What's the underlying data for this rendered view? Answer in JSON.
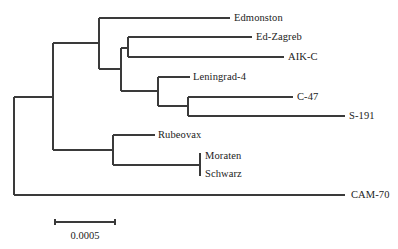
{
  "diagram": {
    "type": "phylogenetic-tree",
    "line_color": "#3a3a3a",
    "text_color": "#222222",
    "taxa": [
      {
        "name": "Edmonston",
        "y": 18,
        "x_end": 230,
        "label_x": 234
      },
      {
        "name": "Ed-Zagreb",
        "y": 37,
        "x_end": 252,
        "label_x": 256
      },
      {
        "name": "AIK-C",
        "y": 57,
        "x_end": 284,
        "label_x": 288
      },
      {
        "name": "Leningrad-4",
        "y": 77,
        "x_end": 190,
        "label_x": 193
      },
      {
        "name": "C-47",
        "y": 97,
        "x_end": 293,
        "label_x": 297
      },
      {
        "name": "S-191",
        "y": 116,
        "x_end": 345,
        "label_x": 349
      },
      {
        "name": "Rubeovax",
        "y": 135,
        "x_end": 155,
        "label_x": 158
      },
      {
        "name": "Moraten",
        "y": 156,
        "x_end": 200,
        "label_x": 205
      },
      {
        "name": "Schwarz",
        "y": 174,
        "x_end": 200,
        "label_x": 205
      },
      {
        "name": "CAM-70",
        "y": 195,
        "x_end": 345,
        "label_x": 351
      }
    ],
    "internal_nodes": [
      {
        "id": "root",
        "x": 14,
        "y_top": 97,
        "y_bottom": 195,
        "parent_x": null
      },
      {
        "id": "ingroup",
        "x": 53,
        "y_top": 43,
        "y_bottom": 150,
        "parent_x": 14,
        "y": 97
      },
      {
        "id": "edmonston-clade",
        "x": 99,
        "y_top": 18,
        "y_bottom": 69,
        "parent_x": 53,
        "y": 43
      },
      {
        "id": "zagreb-leningrad",
        "x": 121,
        "y_top": 48,
        "y_bottom": 91,
        "parent_x": 99,
        "y": 69
      },
      {
        "id": "zagreb-aikc",
        "x": 128,
        "y_top": 37,
        "y_bottom": 57,
        "parent_x": 121,
        "y": 48
      },
      {
        "id": "leningrad-clade",
        "x": 158,
        "y_top": 77,
        "y_bottom": 106,
        "parent_x": 121,
        "y": 91
      },
      {
        "id": "c47-s191",
        "x": 188,
        "y_top": 97,
        "y_bottom": 116,
        "parent_x": 158,
        "y": 106
      },
      {
        "id": "rubeovax-clade",
        "x": 113,
        "y_top": 135,
        "y_bottom": 165,
        "parent_x": 53,
        "y": 150
      },
      {
        "id": "moraten-schwarz",
        "x": 200,
        "y_top": 153,
        "y_bottom": 176,
        "parent_x": 113,
        "y": 165
      }
    ],
    "leaf_parents": {
      "Edmonston": 99,
      "Ed-Zagreb": 128,
      "AIK-C": 128,
      "Leningrad-4": 158,
      "C-47": 188,
      "S-191": 188,
      "Rubeovax": 113,
      "CAM-70": 14
    },
    "scale_bar": {
      "label": "0.0005",
      "x1": 55,
      "x2": 115,
      "y": 222,
      "label_y": 236
    }
  }
}
